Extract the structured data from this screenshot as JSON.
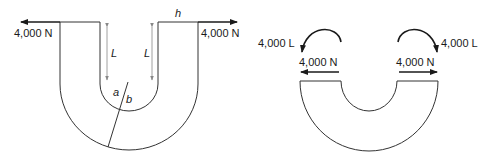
{
  "figures": {
    "left": {
      "force_left_label": "4,000 N",
      "force_right_label": "4,000 N",
      "thickness_label": "h",
      "length_label_left": "L",
      "length_label_right": "L",
      "inner_point_label": "a",
      "outer_point_label": "b"
    },
    "right": {
      "moment_left_label": "4,000 L",
      "moment_right_label": "4,000 L",
      "force_left_label": "4,000 N",
      "force_right_label": "4,000 N"
    }
  },
  "colors": {
    "stroke": "#333333",
    "arrow": "#1a1a1a",
    "dimension": "#888888",
    "background": "#ffffff"
  }
}
